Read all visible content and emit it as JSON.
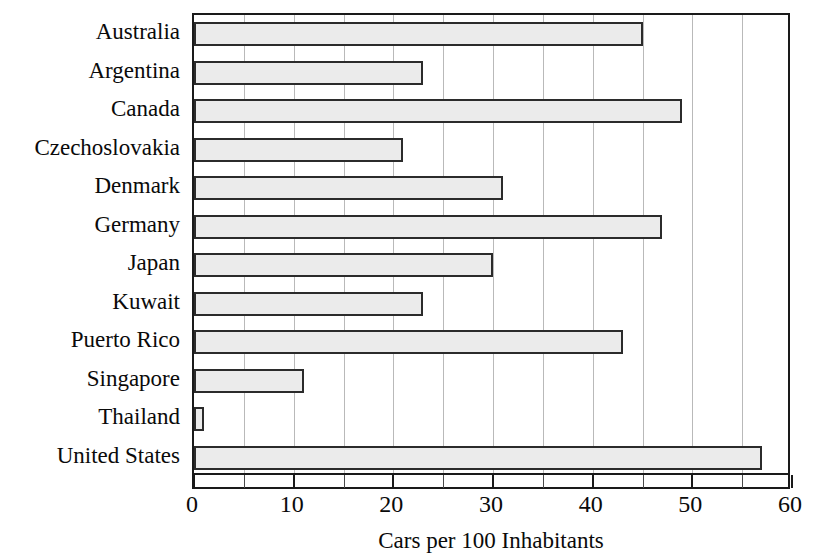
{
  "chart_data": {
    "type": "bar",
    "orientation": "horizontal",
    "title": "",
    "xlabel": "Cars per 100 Inhabitants",
    "ylabel": "",
    "categories": [
      "Australia",
      "Argentina",
      "Canada",
      "Czechoslovakia",
      "Denmark",
      "Germany",
      "Japan",
      "Kuwait",
      "Puerto Rico",
      "Singapore",
      "Thailand",
      "United States"
    ],
    "values": [
      45,
      23,
      49,
      21,
      31,
      47,
      30,
      23,
      43,
      11,
      1,
      57
    ],
    "xlim": [
      0,
      60
    ],
    "xticks": [
      0,
      10,
      20,
      30,
      40,
      50,
      60
    ],
    "xticklabels": [
      "0",
      "10",
      "20",
      "30",
      "40",
      "50",
      "60"
    ],
    "minor_tick_interval": 5,
    "grid": "vertical",
    "legend": "none",
    "bar_fill_color": "#ebebeb",
    "bar_edge_color": "#2b2b2b",
    "gridline_color": "#b9b9b9",
    "axis_color": "#1a1a1a"
  }
}
